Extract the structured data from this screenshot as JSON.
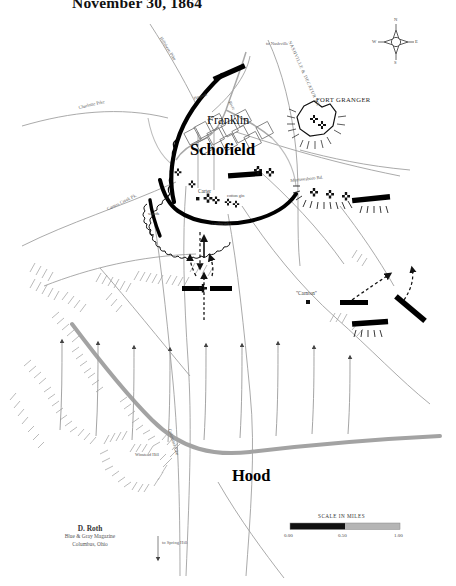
{
  "title": "November 30, 1864",
  "commanders": [
    {
      "name": "Schofield",
      "side": "union",
      "x": 190,
      "y": 140
    },
    {
      "name": "Hood",
      "side": "confederate",
      "x": 232,
      "y": 466
    }
  ],
  "places": [
    {
      "name": "Franklin",
      "x": 207,
      "y": 113
    },
    {
      "name": "FORT GRANGER",
      "x": 316,
      "y": 96
    },
    {
      "name": "Carter",
      "x": 198,
      "y": 192
    },
    {
      "name": "cotton gin",
      "x": 225,
      "y": 196
    },
    {
      "name": "earthworks",
      "x": 216,
      "y": 219
    },
    {
      "name": "woods",
      "x": 153,
      "y": 211
    },
    {
      "name": "\"Carnton\"",
      "x": 300,
      "y": 292
    },
    {
      "name": "Winstead Hill",
      "x": 138,
      "y": 455
    },
    {
      "name": "Harpeth",
      "x": 196,
      "y": 97
    },
    {
      "name": "River",
      "x": 232,
      "y": 100
    }
  ],
  "roads": [
    {
      "name": "Hillsboro Pike",
      "x": 163,
      "y": 36,
      "rot": 58
    },
    {
      "name": "Charlotte Pike",
      "x": 78,
      "y": 105,
      "rot": -14
    },
    {
      "name": "to Nashville",
      "x": 266,
      "y": 41,
      "rot": 0
    },
    {
      "name": "NASHVILLE & DECATUR RR",
      "x": 290,
      "y": 40,
      "rot": 66
    },
    {
      "name": "Murfreesboro Rd.",
      "x": 290,
      "y": 178,
      "rot": -7
    },
    {
      "name": "Carters Creek Pk.",
      "x": 112,
      "y": 205,
      "rot": 58
    },
    {
      "name": "Columbia Pike",
      "x": 172,
      "y": 430,
      "rot": 73
    },
    {
      "name": "to Spring Hill",
      "x": 160,
      "y": 543,
      "rot": 0
    }
  ],
  "compass": {
    "n": "N",
    "s": "S",
    "e": "E",
    "w": "W",
    "x": 396,
    "y": 42
  },
  "scale": {
    "title": "SCALE IN MILES",
    "ticks": [
      "0.00",
      "0.50",
      "1.00"
    ],
    "fill_color": "#111111",
    "empty_color": "#b5b5b5"
  },
  "credit": {
    "author": "D. Roth",
    "line2": "Blue & Gray Magazine",
    "line3": "Columbus, Ohio"
  },
  "colors": {
    "union_line": "#000000",
    "confederate_bar": "#000000",
    "river": "#9a9a9a",
    "ridge": "#9e9e9e",
    "road": "#8c8c8c",
    "hachure": "#b0b0b0",
    "paper": "#ffffff"
  },
  "legend_symbols": {
    "union_breastworks": "thick-curved-line-with-scallops",
    "confederate_brigade": "solid-black-bar",
    "cross_marker": "battle-cross",
    "movement_arrow": "dashed-arrow",
    "terrain": "hachure-marks"
  }
}
